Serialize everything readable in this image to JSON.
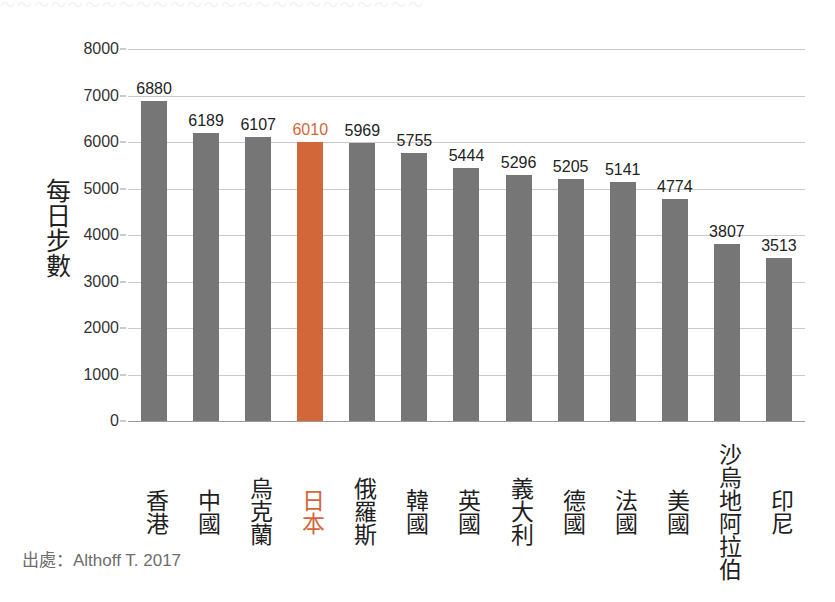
{
  "figure": {
    "top_cut_text": "〜〜〜〜〜〜〜〜〜〜〜〜〜〜〜〜〜〜〜〜〜〜〜〜〜",
    "source_note": "出處：Althoff T. 2017",
    "highlight_color": "#d2683a",
    "bar_color": "#767676",
    "gridline_color": "#c9c9c9"
  },
  "chart_data": {
    "type": "bar",
    "title": "",
    "xlabel": "",
    "ylabel": "每日步數",
    "ylim": [
      0,
      8000
    ],
    "ytick_values": [
      0,
      1000,
      2000,
      3000,
      4000,
      5000,
      6000,
      7000,
      8000
    ],
    "ytick_labels": [
      "0",
      "1000",
      "2000",
      "3000",
      "4000",
      "5000",
      "6000",
      "7000",
      "8000"
    ],
    "grid": true,
    "legend": "none",
    "highlight_category": "日本",
    "categories": [
      "香港",
      "中國",
      "烏克蘭",
      "日本",
      "俄羅斯",
      "韓國",
      "英國",
      "義大利",
      "德國",
      "法國",
      "美國",
      "沙烏地阿拉伯",
      "印尼"
    ],
    "values": [
      6880,
      6189,
      6107,
      6010,
      5969,
      5755,
      5444,
      5296,
      5205,
      5141,
      4774,
      3807,
      3513
    ],
    "value_labels": [
      "6880",
      "6189",
      "6107",
      "6010",
      "5969",
      "5755",
      "5444",
      "5296",
      "5205",
      "5141",
      "4774",
      "3807",
      "3513"
    ]
  }
}
